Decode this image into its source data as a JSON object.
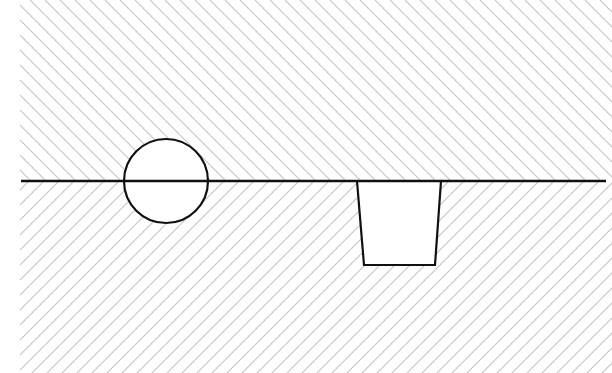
{
  "diagram": {
    "colors": {
      "background": "#ffffff",
      "stroke": "#111111",
      "hatch": "#c4c4c4"
    },
    "boundary_line": {
      "x1": 21,
      "y1": 181,
      "x2": 606,
      "y2": 181
    },
    "upper_region": {
      "x": 20,
      "y": 0,
      "width": 592,
      "height": 181,
      "hatch_direction": "backslash",
      "hatch_spacing": 15
    },
    "lower_region": {
      "x": 20,
      "y": 181,
      "width": 592,
      "height": 192,
      "hatch_direction": "slash",
      "hatch_spacing": 15
    },
    "circle": {
      "cx": 166,
      "cy": 181,
      "r": 42
    },
    "trapezoid": {
      "points": "357,181 441,181 435,265 364,265"
    }
  }
}
